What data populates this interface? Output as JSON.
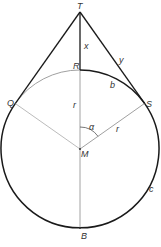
{
  "diagram": {
    "labels": {
      "T": "T",
      "R": "R",
      "Q": "Q",
      "S": "S",
      "M": "M",
      "B": "B",
      "x": "x",
      "y": "y",
      "b": "b",
      "r_vertical": "r",
      "r_slant": "r",
      "alpha": "α",
      "c": "c"
    },
    "colors": {
      "bold": "#1a1a1a",
      "thin": "#999999",
      "text": "#333333"
    }
  }
}
